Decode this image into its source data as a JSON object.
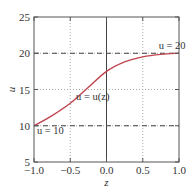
{
  "chart_data": {
    "type": "line",
    "title": "",
    "xlabel": "z",
    "ylabel": "u",
    "xlim": [
      -1.0,
      1.0
    ],
    "ylim": [
      5,
      25
    ],
    "xticks": [
      -1.0,
      -0.5,
      0.0,
      0.5,
      1.0
    ],
    "xtick_labels": [
      "−1.0",
      "−0.5",
      "0.0",
      "0.5",
      "1.0"
    ],
    "yticks": [
      5,
      10,
      15,
      20,
      25
    ],
    "ytick_labels": [
      "5",
      "10",
      "15",
      "20",
      "25"
    ],
    "grid": "dotted",
    "series": [
      {
        "name": "u = u(z)",
        "color": "#c0444f",
        "x": [
          -1.0,
          -0.75,
          -0.5,
          -0.25,
          0.0,
          0.25,
          0.5,
          0.75,
          1.0
        ],
        "y": [
          10.0,
          11.4,
          13.1,
          15.3,
          17.5,
          18.8,
          19.5,
          19.85,
          20.0
        ]
      }
    ],
    "reference_lines": [
      {
        "type": "horizontal",
        "y": 20,
        "style": "dashed",
        "label": "u = 20"
      },
      {
        "type": "horizontal",
        "y": 10,
        "style": "dashed",
        "label": "u = 10"
      },
      {
        "type": "vertical",
        "x": 0.0,
        "style": "solid"
      }
    ],
    "annotations": [
      {
        "text": "u = 20",
        "x": 0.72,
        "y": 20.6
      },
      {
        "text": "u = u(z)",
        "x": -0.42,
        "y": 13.6
      },
      {
        "text": "u = 10",
        "x": -0.96,
        "y": 8.8
      }
    ]
  }
}
